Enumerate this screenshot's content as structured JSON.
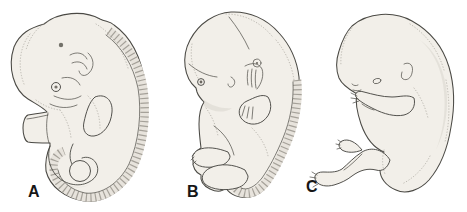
{
  "panels": [
    {
      "label": "A"
    },
    {
      "label": "B"
    },
    {
      "label": "C"
    }
  ],
  "colors": {
    "paper": "#ffffff",
    "ink": "#4a4944",
    "body_fill": "#f2efe9",
    "shade": "#8f8b83",
    "band": "#e7e3dc",
    "soft": "#c7c3ba"
  }
}
